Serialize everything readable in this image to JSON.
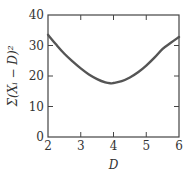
{
  "chart_data": {
    "type": "line",
    "title": "",
    "xlabel": "D",
    "ylabel": "Σ(Xᵢ − D)²",
    "xlim": [
      2,
      6
    ],
    "ylim": [
      0,
      40
    ],
    "xticks": [
      2,
      3,
      4,
      5,
      6
    ],
    "yticks": [
      0,
      10,
      20,
      30,
      40
    ],
    "grid": false,
    "legend": null,
    "series": [
      {
        "name": "sum of squared deviations",
        "color": "#555555",
        "x": [
          2.0,
          2.25,
          2.5,
          2.75,
          3.0,
          3.25,
          3.5,
          3.75,
          3.9,
          4.0,
          4.25,
          4.5,
          4.75,
          5.0,
          5.25,
          5.5,
          5.75,
          6.0
        ],
        "y": [
          33.5,
          30.3,
          27.3,
          24.8,
          22.5,
          20.5,
          19.0,
          17.9,
          17.6,
          17.7,
          18.3,
          19.5,
          21.2,
          23.4,
          26.0,
          28.9,
          30.9,
          32.8
        ]
      }
    ]
  }
}
